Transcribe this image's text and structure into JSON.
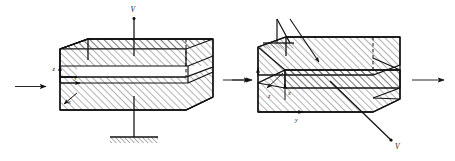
{
  "figure": {
    "background_color": "#ffffff",
    "ink_color": "#111111",
    "hatch_color": "#333333",
    "width": 455,
    "height": 161
  },
  "diagrams": [
    {
      "id": "undeformed",
      "name": "undeformed-block",
      "caption": "Undeformed block with vertical load V and fixed ground support",
      "axes": [
        {
          "name": "z-axis",
          "label": "z",
          "direction": "up"
        },
        {
          "name": "y-axis",
          "label": "y",
          "direction": "right"
        },
        {
          "name": "x-axis",
          "label": "x",
          "direction": "down-left"
        }
      ],
      "load": {
        "label": "V",
        "direction": "down",
        "applied_at": "top-face"
      },
      "support": {
        "type": "fixed-ground",
        "label": "",
        "position": "bottom-face"
      },
      "incoming_arrow": {
        "name": "left-force-arrow",
        "direction": "right"
      }
    },
    {
      "id": "deformed",
      "name": "deformed-block",
      "caption": "Sheared block with load V and pinned support",
      "axes": [
        {
          "name": "z-axis",
          "label": "z",
          "direction": "down-left"
        },
        {
          "name": "x-axis",
          "label": "x",
          "direction": "up"
        },
        {
          "name": "y-axis",
          "label": "y",
          "direction": "right"
        }
      ],
      "load": {
        "label": "V",
        "direction": "down-right",
        "applied_at": "front-face"
      },
      "support": {
        "type": "pinned-hatched",
        "label": "",
        "position": "top-left"
      },
      "incoming_arrow": {
        "name": "left-force-arrow",
        "direction": "right"
      },
      "outgoing_arrow": {
        "name": "right-force-arrow",
        "direction": "right"
      }
    }
  ],
  "connectors": [
    {
      "name": "transition-arrow",
      "direction": "right",
      "label": ""
    }
  ]
}
